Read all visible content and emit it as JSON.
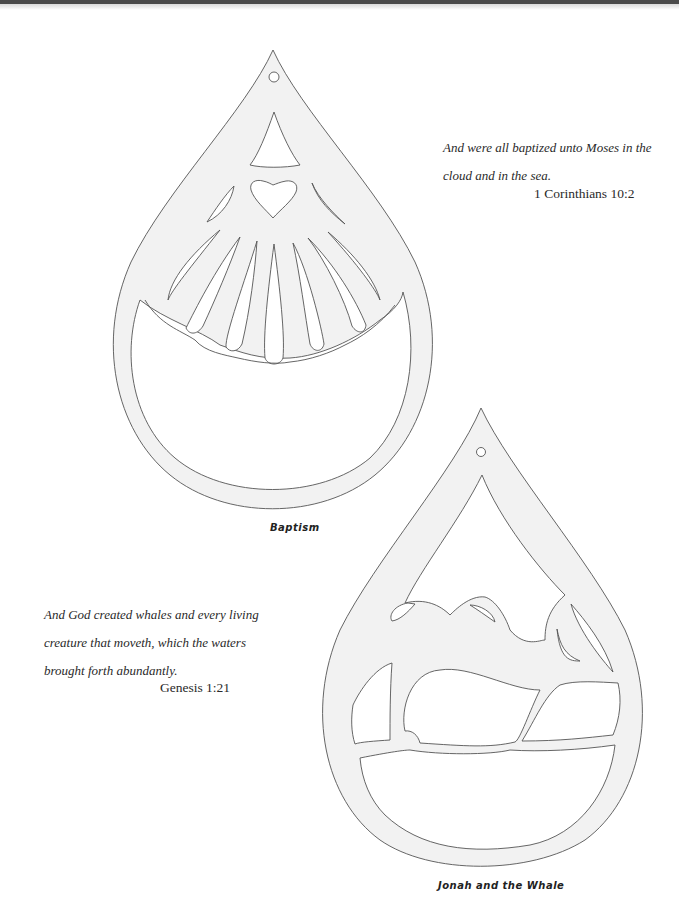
{
  "page": {
    "background": "#ffffff",
    "pattern_fill": "#f2f2f2",
    "line_color": "#555555"
  },
  "patterns": [
    {
      "title": "Baptism",
      "verse": {
        "lines": [
          "And were all baptized unto Moses in the",
          "cloud and in the sea."
        ],
        "reference": "1 Corinthians 10:2"
      }
    },
    {
      "title": "Jonah and the Whale",
      "verse": {
        "lines": [
          "And God created whales and every living",
          "creature that moveth, which the waters",
          "brought forth abundantly."
        ],
        "reference": "Genesis 1:21"
      }
    }
  ]
}
